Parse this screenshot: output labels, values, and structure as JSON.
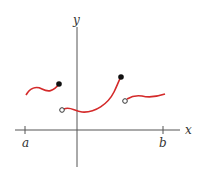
{
  "figure": {
    "type": "piecewise-function-graph",
    "axes": {
      "x_label": "x",
      "y_label": "y",
      "ticks": [
        {
          "label": "a"
        },
        {
          "label": "b"
        }
      ]
    },
    "curve_color": "#d42a2a",
    "axis_color": "#555555",
    "pieces": [
      {
        "name": "left-piece",
        "left_endpoint": "none",
        "right_endpoint": "closed"
      },
      {
        "name": "middle-piece",
        "left_endpoint": "open",
        "right_endpoint": "closed"
      },
      {
        "name": "right-piece",
        "left_endpoint": "open",
        "right_endpoint": "none"
      }
    ]
  }
}
